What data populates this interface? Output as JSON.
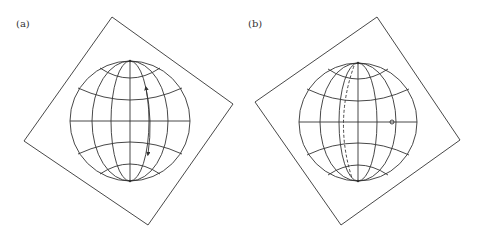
{
  "figure": {
    "background": "#ffffff",
    "stroke_color": "#333333",
    "panels": [
      {
        "id": "a",
        "label": "(a)",
        "label_pos": [
          16,
          28
        ],
        "square": [
          [
            112,
            17
          ],
          [
            233,
            104
          ],
          [
            148,
            225
          ],
          [
            24,
            141
          ]
        ],
        "globe": {
          "cx": 130,
          "cy": 121,
          "r": 60
        },
        "meridian_offsets": [
          19,
          38
        ],
        "parallels": [
          {
            "edge_y": 68,
            "edge_x_off": 30,
            "mid_y": 78
          },
          {
            "edge_y": 88,
            "edge_x_off": 52,
            "mid_y": 100
          },
          {
            "edge_y": 154,
            "edge_x_off": 52,
            "mid_y": 142
          },
          {
            "edge_y": 174,
            "edge_x_off": 30,
            "mid_y": 164
          }
        ],
        "annotation": {
          "type": "double-arrow",
          "description": "curved double-headed arrow along a meridian",
          "path": "M146,88 Q153,121 148,154"
        }
      },
      {
        "id": "b",
        "label": "(b)",
        "label_pos": [
          248,
          28
        ],
        "square": [
          [
            377,
            17
          ],
          [
            460,
            140
          ],
          [
            341,
            225
          ],
          [
            255,
            102
          ]
        ],
        "globe": {
          "cx": 358,
          "cy": 122,
          "r": 59
        },
        "meridian_offsets": [
          19,
          38
        ],
        "parallels": [
          {
            "edge_y": 69,
            "edge_x_off": 30,
            "mid_y": 79
          },
          {
            "edge_y": 89,
            "edge_x_off": 51,
            "mid_y": 101
          },
          {
            "edge_y": 155,
            "edge_x_off": 51,
            "mid_y": 143
          },
          {
            "edge_y": 175,
            "edge_x_off": 30,
            "mid_y": 165
          }
        ],
        "annotation": {
          "type": "dashed-meridian-and-point",
          "description": "dashed curve beside a meridian and a small circled point on the equator",
          "path": "M354,66 Q334,122 352,178",
          "point": [
            392,
            122
          ],
          "point_r": 2
        }
      }
    ]
  }
}
